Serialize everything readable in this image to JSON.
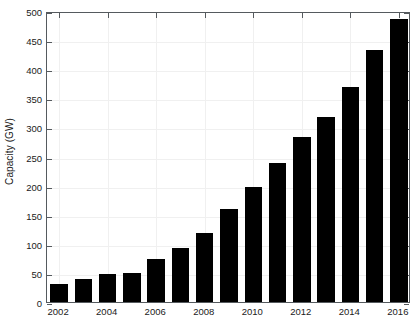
{
  "chart_data": {
    "type": "bar",
    "title": "",
    "xlabel": "",
    "ylabel": "Capacity (GW)",
    "categories": [
      "2002",
      "2003",
      "2004",
      "2005",
      "2006",
      "2007",
      "2008",
      "2009",
      "2010",
      "2011",
      "2012",
      "2013",
      "2014",
      "2015",
      "2016"
    ],
    "values": [
      31,
      40,
      48,
      50,
      74,
      93,
      119,
      159,
      198,
      238,
      283,
      318,
      370,
      433,
      487
    ],
    "ylim": [
      0,
      500
    ],
    "yticks": [
      0,
      50,
      100,
      150,
      200,
      250,
      300,
      350,
      400,
      450,
      500
    ],
    "ytick_labels": [
      "0",
      "50",
      "100",
      "150",
      "200",
      "250",
      "300",
      "350",
      "400",
      "450",
      "500"
    ],
    "xtick_labels": [
      "2002",
      "2004",
      "2006",
      "2008",
      "2010",
      "2012",
      "2014",
      "2016"
    ],
    "xtick_categories": [
      "2002",
      "2004",
      "2006",
      "2008",
      "2010",
      "2012",
      "2014",
      "2016"
    ],
    "grid": true,
    "legend": null,
    "bar_color": "#000000",
    "axis_color": "#555a5e",
    "grid_color": "#f0f0f0",
    "background_color": "#ffffff"
  },
  "figure": {
    "y_axis_title": "Capacity (GW)"
  }
}
